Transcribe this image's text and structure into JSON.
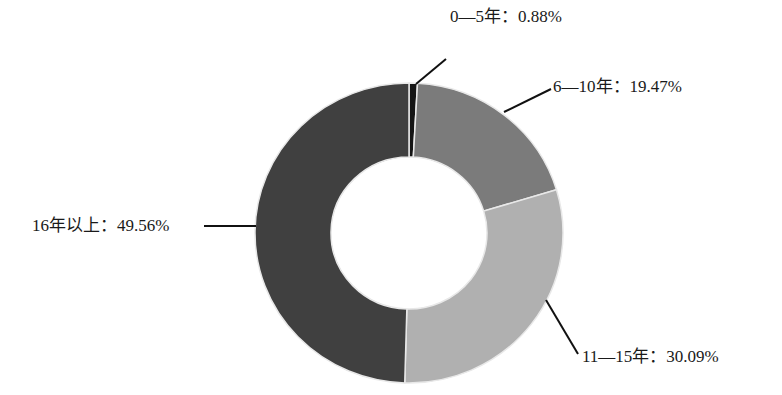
{
  "chart_data": {
    "type": "pie",
    "subtype": "donut",
    "title": "",
    "categories": [
      "0—5年",
      "6—10年",
      "11—15年",
      "16年以上"
    ],
    "values": [
      0.88,
      19.47,
      30.09,
      49.56
    ],
    "unit": "%",
    "colors": [
      "#151515",
      "#7b7b7b",
      "#b0b0b0",
      "#404040"
    ],
    "start_angle": "top, clockwise",
    "legend": "none (data labels with leader lines)"
  },
  "labels": [
    {
      "text": "0—5年：0.88%"
    },
    {
      "text": "6—10年：19.47%"
    },
    {
      "text": "11—15年：30.09%"
    },
    {
      "text": "16年以上：49.56%"
    }
  ],
  "geometry": {
    "cx": 409,
    "cy": 233,
    "rx": 154,
    "ry": 150,
    "irx": 78,
    "iry": 76,
    "separator_color": "#e8e8e8",
    "leaders": [
      {
        "x1": 416,
        "y1": 84,
        "x2": 446,
        "y2": 59
      },
      {
        "x1": 504,
        "y1": 112,
        "x2": 551,
        "y2": 89
      },
      {
        "x1": 546,
        "y1": 300,
        "x2": 578,
        "y2": 354
      },
      {
        "x1": 204,
        "y1": 226,
        "x2": 256,
        "y2": 226
      }
    ],
    "label_positions": [
      {
        "left": 450,
        "top": 7
      },
      {
        "left": 553,
        "top": 77
      },
      {
        "left": 582,
        "top": 347
      },
      {
        "left": 32,
        "top": 216
      }
    ]
  }
}
